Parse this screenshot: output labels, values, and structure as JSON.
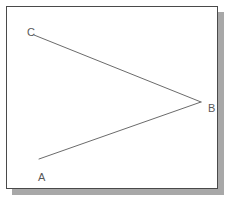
{
  "figure": {
    "name": "angle-abc-diagram",
    "frame": {
      "border_color": "#4a4a4a",
      "background_color": "#ffffff",
      "shadow_color": "#a8a8a8"
    },
    "stroke_color": "#6b6b6b",
    "stroke_width": 1,
    "label_color": "#585858",
    "points": [
      {
        "id": "A",
        "label": "A",
        "x": 32,
        "y": 152
      },
      {
        "id": "B",
        "label": "B",
        "x": 194,
        "y": 95
      },
      {
        "id": "C",
        "label": "C",
        "x": 27,
        "y": 28
      }
    ],
    "segments": [
      {
        "id": "ray-BA",
        "from": "B",
        "to": "A"
      },
      {
        "id": "ray-BC",
        "from": "B",
        "to": "C"
      }
    ]
  }
}
